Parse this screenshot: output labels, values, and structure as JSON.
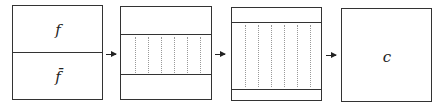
{
  "diagram": {
    "boxes": [
      {
        "id": "box1",
        "labels": {
          "top": "f",
          "bottom": "f̄"
        }
      },
      {
        "id": "box2",
        "band": "dotted-middle"
      },
      {
        "id": "box3",
        "band": "dotted-expanded"
      },
      {
        "id": "box4",
        "labels": {
          "center": "c"
        }
      }
    ],
    "arrows": [
      "box1->box2",
      "box2->box3",
      "box3->box4"
    ]
  }
}
